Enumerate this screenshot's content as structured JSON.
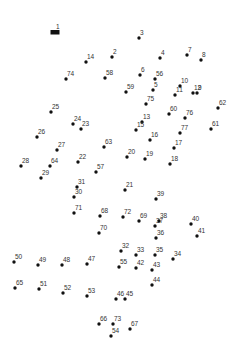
{
  "puzzle": {
    "type": "connect-the-dots",
    "start_label": "1",
    "colors": {
      "dot": "#111111",
      "label": "#333333",
      "background": "#ffffff"
    },
    "points": [
      {
        "n": 1,
        "x": 55,
        "y": 32
      },
      {
        "n": 2,
        "x": 112,
        "y": 57
      },
      {
        "n": 3,
        "x": 139,
        "y": 38
      },
      {
        "n": 4,
        "x": 160,
        "y": 58
      },
      {
        "n": 5,
        "x": 153,
        "y": 90
      },
      {
        "n": 6,
        "x": 140,
        "y": 75
      },
      {
        "n": 7,
        "x": 187,
        "y": 55
      },
      {
        "n": 8,
        "x": 201,
        "y": 60
      },
      {
        "n": 9,
        "x": 197,
        "y": 93
      },
      {
        "n": 10,
        "x": 180,
        "y": 86
      },
      {
        "n": 11,
        "x": 175,
        "y": 95
      },
      {
        "n": 12,
        "x": 193,
        "y": 93
      },
      {
        "n": 13,
        "x": 142,
        "y": 122
      },
      {
        "n": 14,
        "x": 86,
        "y": 62
      },
      {
        "n": 15,
        "x": 136,
        "y": 130
      },
      {
        "n": 16,
        "x": 150,
        "y": 140
      },
      {
        "n": 17,
        "x": 174,
        "y": 148
      },
      {
        "n": 18,
        "x": 170,
        "y": 164
      },
      {
        "n": 19,
        "x": 145,
        "y": 159
      },
      {
        "n": 20,
        "x": 127,
        "y": 157
      },
      {
        "n": 21,
        "x": 125,
        "y": 190
      },
      {
        "n": 22,
        "x": 78,
        "y": 162
      },
      {
        "n": 23,
        "x": 81,
        "y": 129
      },
      {
        "n": 24,
        "x": 73,
        "y": 124
      },
      {
        "n": 25,
        "x": 51,
        "y": 112
      },
      {
        "n": 26,
        "x": 37,
        "y": 137
      },
      {
        "n": 27,
        "x": 57,
        "y": 150
      },
      {
        "n": 28,
        "x": 21,
        "y": 166
      },
      {
        "n": 29,
        "x": 41,
        "y": 178
      },
      {
        "n": 30,
        "x": 74,
        "y": 197
      },
      {
        "n": 31,
        "x": 77,
        "y": 187
      },
      {
        "n": 32,
        "x": 121,
        "y": 251
      },
      {
        "n": 33,
        "x": 136,
        "y": 255
      },
      {
        "n": 34,
        "x": 173,
        "y": 259
      },
      {
        "n": 35,
        "x": 155,
        "y": 255
      },
      {
        "n": 36,
        "x": 156,
        "y": 238
      },
      {
        "n": 37,
        "x": 155,
        "y": 226
      },
      {
        "n": 38,
        "x": 159,
        "y": 221
      },
      {
        "n": 39,
        "x": 156,
        "y": 199
      },
      {
        "n": 40,
        "x": 191,
        "y": 224
      },
      {
        "n": 41,
        "x": 197,
        "y": 236
      },
      {
        "n": 42,
        "x": 136,
        "y": 268
      },
      {
        "n": 43,
        "x": 152,
        "y": 270
      },
      {
        "n": 44,
        "x": 152,
        "y": 285
      },
      {
        "n": 45,
        "x": 125,
        "y": 299
      },
      {
        "n": 46,
        "x": 116,
        "y": 299
      },
      {
        "n": 47,
        "x": 87,
        "y": 264
      },
      {
        "n": 48,
        "x": 62,
        "y": 265
      },
      {
        "n": 49,
        "x": 38,
        "y": 265
      },
      {
        "n": 50,
        "x": 14,
        "y": 262
      },
      {
        "n": 51,
        "x": 39,
        "y": 289
      },
      {
        "n": 52,
        "x": 63,
        "y": 293
      },
      {
        "n": 53,
        "x": 87,
        "y": 296
      },
      {
        "n": 54,
        "x": 111,
        "y": 336
      },
      {
        "n": 55,
        "x": 119,
        "y": 267
      },
      {
        "n": 56,
        "x": 155,
        "y": 79
      },
      {
        "n": 57,
        "x": 96,
        "y": 172
      },
      {
        "n": 58,
        "x": 105,
        "y": 78
      },
      {
        "n": 59,
        "x": 126,
        "y": 92
      },
      {
        "n": 60,
        "x": 169,
        "y": 114
      },
      {
        "n": 61,
        "x": 211,
        "y": 129
      },
      {
        "n": 62,
        "x": 218,
        "y": 108
      },
      {
        "n": 63,
        "x": 104,
        "y": 147
      },
      {
        "n": 64,
        "x": 50,
        "y": 166
      },
      {
        "n": 65,
        "x": 15,
        "y": 288
      },
      {
        "n": 66,
        "x": 99,
        "y": 324
      },
      {
        "n": 67,
        "x": 130,
        "y": 329
      },
      {
        "n": 68,
        "x": 100,
        "y": 216
      },
      {
        "n": 69,
        "x": 139,
        "y": 221
      },
      {
        "n": 70,
        "x": 99,
        "y": 233
      },
      {
        "n": 71,
        "x": 74,
        "y": 213
      },
      {
        "n": 72,
        "x": 123,
        "y": 217
      },
      {
        "n": 73,
        "x": 113,
        "y": 324
      },
      {
        "n": 74,
        "x": 66,
        "y": 79
      },
      {
        "n": 75,
        "x": 146,
        "y": 104
      },
      {
        "n": 76,
        "x": 185,
        "y": 118
      },
      {
        "n": 77,
        "x": 180,
        "y": 133
      }
    ]
  }
}
